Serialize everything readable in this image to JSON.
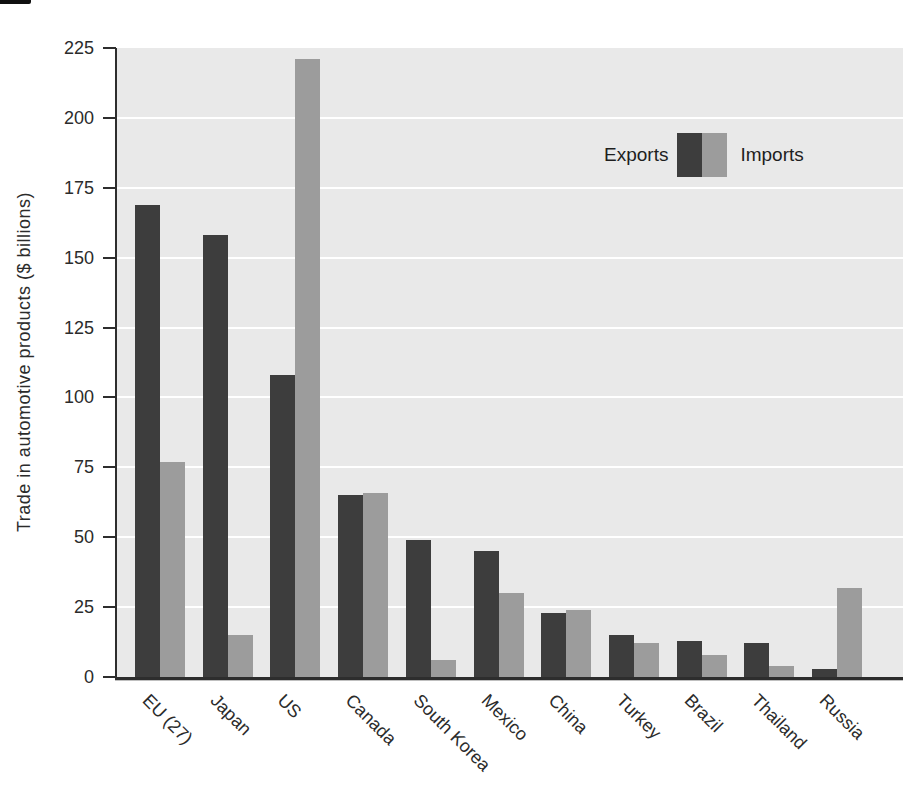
{
  "figure": {
    "background": "#ffffff",
    "plot_background": "#e9e9e9",
    "gridline_color": "#ffffff",
    "axis_color": "#2d2d2d",
    "text_color": "#2b2b2b"
  },
  "legend": {
    "exports_label": "Exports",
    "imports_label": "Imports",
    "exports_color": "#3d3d3d",
    "imports_color": "#9c9c9c"
  },
  "chart_data": {
    "type": "bar",
    "title": "",
    "xlabel": "",
    "ylabel": "Trade in automotive products ($ billions)",
    "categories": [
      "EU (27)",
      "Japan",
      "US",
      "Canada",
      "South Korea",
      "Mexico",
      "China",
      "Turkey",
      "Brazil",
      "Thailand",
      "Russia"
    ],
    "series": [
      {
        "name": "Exports",
        "color": "#3d3d3d",
        "values": [
          169,
          158,
          108,
          65,
          49,
          45,
          23,
          15,
          13,
          12,
          3
        ]
      },
      {
        "name": "Imports",
        "color": "#9c9c9c",
        "values": [
          77,
          15,
          221,
          66,
          6,
          30,
          24,
          12,
          8,
          4,
          32
        ]
      }
    ],
    "ylim": [
      0,
      225
    ],
    "yticks": [
      0,
      25,
      50,
      75,
      100,
      125,
      150,
      175,
      200,
      225
    ],
    "grid": "horizontal white gridlines on light gray panel, behind bars",
    "legend_position": "upper right, inside plot area",
    "x_tick_label_rotation_deg": 45
  }
}
